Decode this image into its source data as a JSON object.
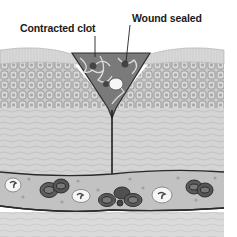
{
  "figure": {
    "labels": {
      "contracted_clot": "Contracted clot",
      "wound_sealed": "Wound sealed"
    },
    "layers": [
      "stratum surface",
      "epidermal cells",
      "dermis",
      "blood vessel",
      "subcutaneous tissue"
    ],
    "colors": {
      "background": "#ffffff",
      "surface": "#d6d6d6",
      "cells": "#c4c4c4",
      "cell_border": "#8a8a8a",
      "dermis": "#d2d2d2",
      "vessel": "#bdbdbd",
      "rbc": "#5a5a5a",
      "wbc": "#f4f4f4",
      "clot": "#6e6e6e",
      "line": "#2a2a2a"
    },
    "vessel_cells": {
      "red_blood_cell_clusters": 4,
      "white_blood_cells": 3
    }
  }
}
